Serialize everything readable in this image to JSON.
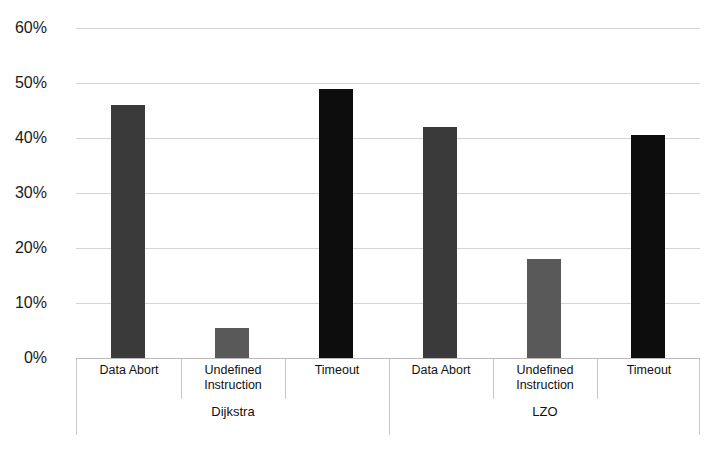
{
  "chart_data": {
    "type": "bar",
    "title": "",
    "xlabel": "",
    "ylabel": "",
    "ylim": [
      0,
      60
    ],
    "ytick_labels": [
      "60%",
      "50%",
      "40%",
      "30%",
      "20%",
      "10%",
      "0%"
    ],
    "ytick_values": [
      60,
      50,
      40,
      30,
      20,
      10,
      0
    ],
    "grid": true,
    "legend": "none",
    "groups": [
      "Dijkstra",
      "LZO"
    ],
    "categories": [
      "Data Abort",
      "Undefined Instruction",
      "Timeout"
    ],
    "series": [
      {
        "name": "Dijkstra",
        "values": [
          46.0,
          5.5,
          49.0
        ]
      },
      {
        "name": "LZO",
        "values": [
          42.0,
          18.0,
          40.5
        ]
      }
    ],
    "bars": [
      {
        "group": "Dijkstra",
        "category": "Data Abort",
        "label_line1": "Data Abort",
        "label_line2": "",
        "value": 46.0,
        "color": "#3a3a3a"
      },
      {
        "group": "Dijkstra",
        "category": "Undefined Instruction",
        "label_line1": "Undefined",
        "label_line2": "Instruction",
        "value": 5.5,
        "color": "#595959"
      },
      {
        "group": "Dijkstra",
        "category": "Timeout",
        "label_line1": "Timeout",
        "label_line2": "",
        "value": 49.0,
        "color": "#0d0d0d"
      },
      {
        "group": "LZO",
        "category": "Data Abort",
        "label_line1": "Data Abort",
        "label_line2": "",
        "value": 42.0,
        "color": "#3a3a3a"
      },
      {
        "group": "LZO",
        "category": "Undefined Instruction",
        "label_line1": "Undefined",
        "label_line2": "Instruction",
        "value": 18.0,
        "color": "#595959"
      },
      {
        "group": "LZO",
        "category": "Timeout",
        "label_line1": "Timeout",
        "label_line2": "",
        "value": 40.5,
        "color": "#0d0d0d"
      }
    ],
    "colors": {
      "data_abort": "#3a3a3a",
      "undefined_instruction": "#595959",
      "timeout": "#0d0d0d",
      "gridline": "#d4d4d4",
      "axis_line": "#c8c8c8",
      "background": "#ffffff",
      "text": "#111111"
    }
  },
  "axis": {
    "yticks": [
      "60%",
      "50%",
      "40%",
      "30%",
      "20%",
      "10%",
      "0%"
    ],
    "category_labels": [
      {
        "line1": "Data Abort",
        "line2": ""
      },
      {
        "line1": "Undefined",
        "line2": "Instruction"
      },
      {
        "line1": "Timeout",
        "line2": ""
      },
      {
        "line1": "Data Abort",
        "line2": ""
      },
      {
        "line1": "Undefined",
        "line2": "Instruction"
      },
      {
        "line1": "Timeout",
        "line2": ""
      }
    ],
    "group_labels": [
      "Dijkstra",
      "LZO"
    ]
  },
  "header": {
    "title_fragment": ""
  }
}
